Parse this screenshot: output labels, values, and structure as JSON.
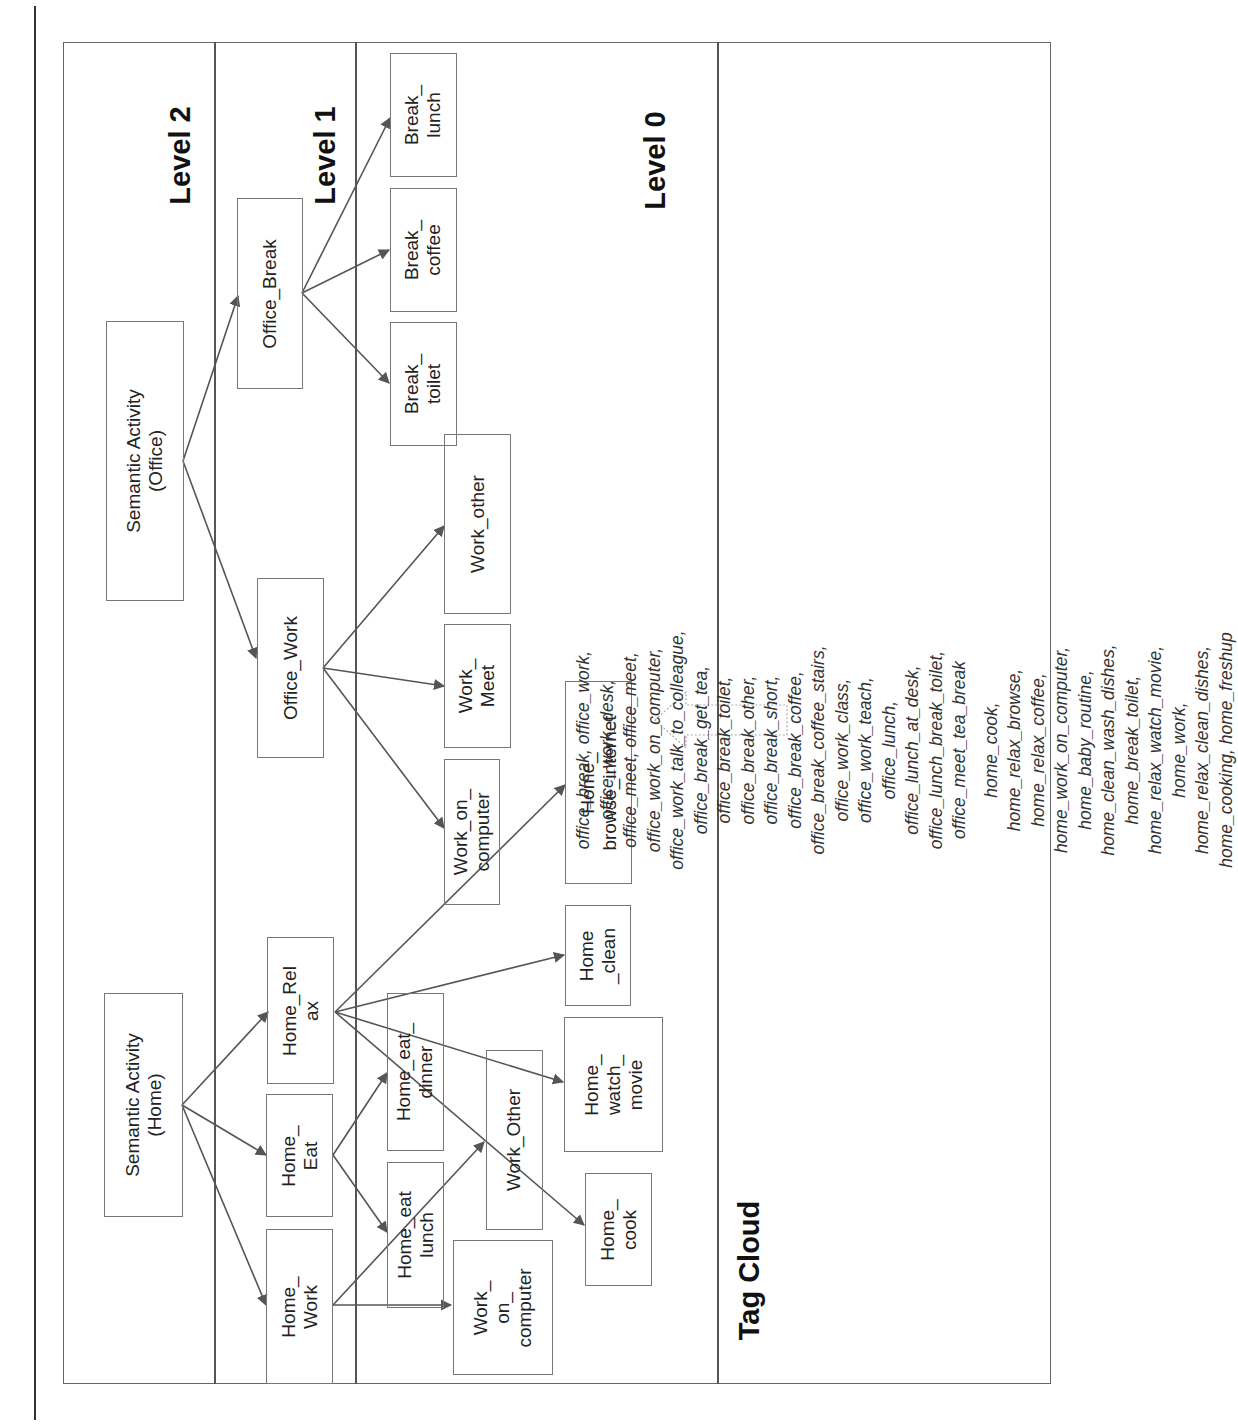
{
  "levels": {
    "level2": "Level 2",
    "level1": "Level 1",
    "level0": "Level 0"
  },
  "nodes": {
    "semantic_office": "Semantic Activity\n(Office)",
    "semantic_home": "Semantic Activity\n(Home)",
    "office_break": "Office_Break",
    "office_work": "Office_Work",
    "home_relax": "Home_Rel\nax",
    "home_eat": "Home_\nEat",
    "home_work": "Home_\nWork",
    "break_lunch": "Break_\nlunch",
    "break_coffee": "Break_\ncoffee",
    "break_toilet": "Break_\ntoilet",
    "work_other": "Work_other",
    "work_meet": "Work_\nMeet",
    "work_on_computer_office": "Work_on_\ncomputer",
    "home_browse_internet": "Home_\nbrowse_internet",
    "home_clean": "Home\n_clean",
    "home_watch_movie": "Home_\nwatch_\nmovie",
    "home_eat_dinner": "Home_eat_\ndinner",
    "work_other_home": "Work_Other",
    "home_cook": "Home_\ncook",
    "home_eat_lunch": "Home_eat\nlunch",
    "work_on_computer_home": "Work_\non_\ncomputer"
  },
  "tag_cloud": {
    "title": "Tag Cloud",
    "office_lines": [
      "office_break, office_work, office_work_desk, office_meet, office_meet, office_work_on_computer,",
      "office_work_talk_to_colleague, office_break_get_tea, office_break_toilet, office_break_other, office_break_short,",
      "office_break_coffee, office_break_coffee_stairs, office_work_class, office_work_teach, office_lunch,",
      "office_lunch_at_desk, office_lunch_break_toilet, office_meet_tea_break"
    ],
    "home_lines": [
      "home_cook, home_relax_browse, home_relax_coffee, home_work_on_computer, home_baby_routine,",
      "home_clean_wash_dishes, home_break_toilet, home_relax_watch_movie, home_work, home_relax_clean_dishes,",
      "home_cooking, home_freshup"
    ]
  },
  "colors": {
    "line": "#555555",
    "box_border": "#777777",
    "text": "#222222"
  }
}
